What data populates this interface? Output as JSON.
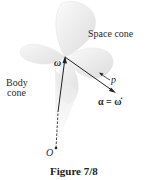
{
  "figure": {
    "caption": "Figure 7/8",
    "labels": {
      "space_cone": "Space cone",
      "body_cone_line1": "Body",
      "body_cone_line2": "cone",
      "omega": "ω",
      "p": "p",
      "alpha": "α = ω̇",
      "origin": "O"
    },
    "colors": {
      "cone_fill": "#f2f2f2",
      "cone_shade": "#d8d8d8",
      "vector": "#222222",
      "text": "#2a2a2a"
    }
  }
}
